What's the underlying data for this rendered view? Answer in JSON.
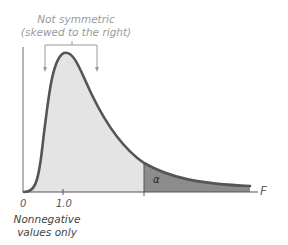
{
  "annotation": {
    "line1": "Not symmetric",
    "line2": "(skewed to the right)"
  },
  "axis": {
    "x_label": "F",
    "tick_zero": "0",
    "tick_one": "1.0"
  },
  "tail_label": "α",
  "footnote": {
    "line1": "Nonnegative",
    "line2": "values only"
  },
  "colors": {
    "curve": "#555555",
    "body_fill": "#e4e4e4",
    "tail_fill": "#8c8c8c",
    "axis": "#6a6a6a",
    "annotation": "#9a9a9a"
  }
}
